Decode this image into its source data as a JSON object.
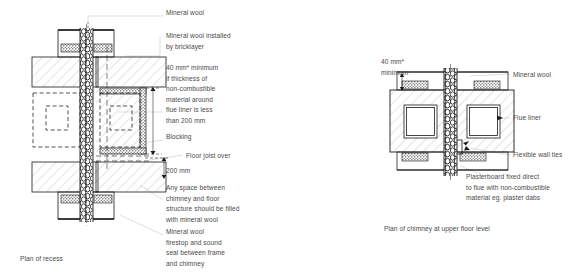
{
  "figure": {
    "type": "technical-diagram",
    "background": "#ffffff",
    "line_color": "#1a1a1a",
    "text_color": "#4a4a4a",
    "leader_color": "#c9c9c9"
  },
  "left_drawing": {
    "caption": "Plan of recess",
    "labels": [
      {
        "id": "mineral-wool",
        "text": "Mineral wool",
        "x": 166,
        "y": 10
      },
      {
        "id": "mineral-wool-bricklayer",
        "text": "Mineral wool installed\nby bricklayer",
        "x": 166,
        "y": 32
      },
      {
        "id": "forty-mm-minimum",
        "text": "40 mm* minimum\nif thickness of\nnon-combustible\nmaterial around\nflue liner is less\nthan 200 mm",
        "x": 166,
        "y": 64
      },
      {
        "id": "blocking",
        "text": "Blocking",
        "x": 166,
        "y": 133
      },
      {
        "id": "floor-joist-over",
        "text": "Floor joist over",
        "x": 186,
        "y": 152
      },
      {
        "id": "two-hundred-mm",
        "text": "200 mm",
        "x": 166,
        "y": 167
      },
      {
        "id": "any-space-between",
        "text": "Any space between\nchimney and floor\nstructure should be filled\nwith mineral wool",
        "x": 166,
        "y": 184
      },
      {
        "id": "mineral-wool-firestop",
        "text": "Mineral wool\nfirestop and sound\nseal between frame\nand chimney",
        "x": 166,
        "y": 228
      }
    ]
  },
  "right_drawing": {
    "caption": "Plan of chimney at upper floor level",
    "labels": [
      {
        "id": "forty-mm-minimum",
        "text": "40 mm*\nminimum",
        "x": 381,
        "y": 58
      },
      {
        "id": "mineral-wool",
        "text": "Mineral wool",
        "x": 513,
        "y": 71
      },
      {
        "id": "flue-liner",
        "text": "Flue liner",
        "x": 513,
        "y": 114
      },
      {
        "id": "flexible-wall-ties",
        "text": "Flexible wall ties",
        "x": 513,
        "y": 151
      },
      {
        "id": "plasterboard-fixed-direct",
        "text": "Plasterboard fixed direct\nto flue with non-combustible\nmaterial eg. plaster dabs",
        "x": 466,
        "y": 173
      }
    ]
  },
  "captions": {
    "left": {
      "text": "Plan of recess",
      "x": 20,
      "y": 255
    },
    "right": {
      "text": "Plan of chimney at upper floor level",
      "x": 384,
      "y": 225
    }
  }
}
